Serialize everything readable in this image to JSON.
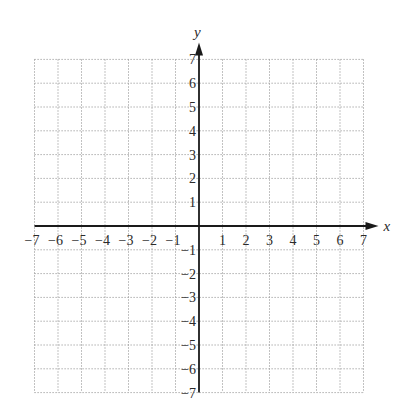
{
  "chart_data": {
    "type": "coordinate-grid",
    "title": "",
    "xlabel": "x",
    "ylabel": "y",
    "xlim": [
      -7,
      7
    ],
    "ylim": [
      -7,
      7
    ],
    "grid": true,
    "grid_style": "dotted",
    "x_ticks": [
      -7,
      -6,
      -5,
      -4,
      -3,
      -2,
      -1,
      1,
      2,
      3,
      4,
      5,
      6,
      7
    ],
    "y_ticks": [
      -7,
      -6,
      -5,
      -4,
      -3,
      -2,
      -1,
      1,
      2,
      3,
      4,
      5,
      6,
      7
    ],
    "x_tick_labels": [
      "−7",
      "−6",
      "−5",
      "−4",
      "−3",
      "−2",
      "−1",
      "1",
      "2",
      "3",
      "4",
      "5",
      "6",
      "7"
    ],
    "y_tick_labels": [
      "−7",
      "−6",
      "−5",
      "−4",
      "−3",
      "−2",
      "−1",
      "1",
      "2",
      "3",
      "4",
      "5",
      "6",
      "7"
    ],
    "series": []
  },
  "axes": {
    "x_label": "x",
    "y_label": "y",
    "axis_color": "#1a1a1a",
    "grid_color": "#9a9a9a"
  },
  "layout": {
    "origin_x": 199,
    "origin_y": 226,
    "unit_x": 23.5,
    "unit_y": 23.8
  }
}
